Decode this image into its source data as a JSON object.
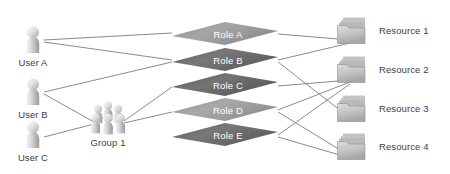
{
  "diagram": {
    "type": "access-control-diagram",
    "background_color": "#ffffff",
    "line_color": "#7d7d7d",
    "label_color": "#3d3d3d"
  },
  "users": [
    {
      "id": "user-a",
      "label": "User A",
      "icon": "person-icon",
      "x": 33,
      "y": 38,
      "label_x": 33,
      "label_y": 63
    },
    {
      "id": "user-b",
      "label": "User B",
      "icon": "person-icon",
      "x": 33,
      "y": 90,
      "label_x": 33,
      "label_y": 115
    },
    {
      "id": "user-c",
      "label": "User C",
      "icon": "person-icon",
      "x": 33,
      "y": 133,
      "label_x": 33,
      "label_y": 158
    }
  ],
  "groups": [
    {
      "id": "group-1",
      "label": "Group 1",
      "icon": "people-group-icon",
      "x": 108,
      "y": 120,
      "label_x": 108,
      "label_y": 143
    }
  ],
  "roles": [
    {
      "id": "role-a",
      "label": "Role A",
      "fill": "#9b9b9b",
      "cx": 225,
      "cy": 35
    },
    {
      "id": "role-b",
      "label": "Role B",
      "fill": "#6d6d6d",
      "cx": 225,
      "cy": 61
    },
    {
      "id": "role-c",
      "label": "Role C",
      "fill": "#6a6a6a",
      "cx": 225,
      "cy": 86
    },
    {
      "id": "role-d",
      "label": "Role D",
      "fill": "#9e9e9e",
      "cx": 225,
      "cy": 111
    },
    {
      "id": "role-e",
      "label": "Role E",
      "fill": "#6d6d6d",
      "cx": 225,
      "cy": 136
    }
  ],
  "resources": [
    {
      "id": "resource-1",
      "label": "Resource 1",
      "icon": "folder-icon",
      "x": 352,
      "y": 30,
      "label_x": 380,
      "label_y": 31
    },
    {
      "id": "resource-2",
      "label": "Resource 2",
      "icon": "folder-icon",
      "x": 352,
      "y": 69,
      "label_x": 380,
      "label_y": 70
    },
    {
      "id": "resource-3",
      "label": "Resource 3",
      "icon": "folder-icon",
      "x": 352,
      "y": 108,
      "label_x": 380,
      "label_y": 109
    },
    {
      "id": "resource-4",
      "label": "Resource 4",
      "icon": "folder-icon",
      "x": 352,
      "y": 146,
      "label_x": 380,
      "label_y": 147
    }
  ],
  "connections": {
    "user_to_role": [
      {
        "from": "user-a",
        "to": "role-a"
      },
      {
        "from": "user-a",
        "to": "role-b"
      },
      {
        "from": "user-b",
        "to": "role-b"
      }
    ],
    "user_to_group": [
      {
        "from": "user-b",
        "to": "group-1"
      },
      {
        "from": "user-c",
        "to": "group-1"
      }
    ],
    "group_to_role": [
      {
        "from": "group-1",
        "to": "role-c"
      },
      {
        "from": "group-1",
        "to": "role-d"
      }
    ],
    "role_to_resource": [
      {
        "from": "role-a",
        "to": "resource-1"
      },
      {
        "from": "role-b",
        "to": "resource-1"
      },
      {
        "from": "role-b",
        "to": "resource-3"
      },
      {
        "from": "role-c",
        "to": "resource-2"
      },
      {
        "from": "role-d",
        "to": "resource-2"
      },
      {
        "from": "role-d",
        "to": "resource-4"
      },
      {
        "from": "role-e",
        "to": "resource-2"
      },
      {
        "from": "role-e",
        "to": "resource-4"
      }
    ]
  }
}
